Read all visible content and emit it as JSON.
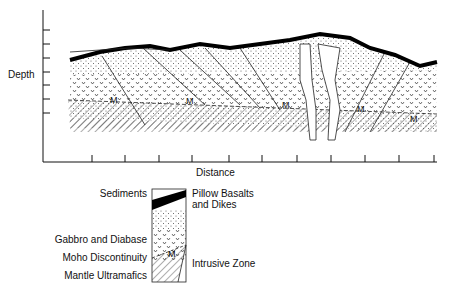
{
  "diagram": {
    "y_axis_label": "Depth",
    "x_axis_label": "Distance",
    "moho_marker": "M",
    "y_ticks": 7,
    "x_ticks": 11
  },
  "legend": {
    "left": [
      "Sediments",
      "Gabbro and Diabase",
      "Moho Discontinuity",
      "Mantle Ultramafics"
    ],
    "right": [
      "Pillow Basalts",
      "and Dikes",
      "Intrusive Zone"
    ],
    "marker": "M"
  }
}
